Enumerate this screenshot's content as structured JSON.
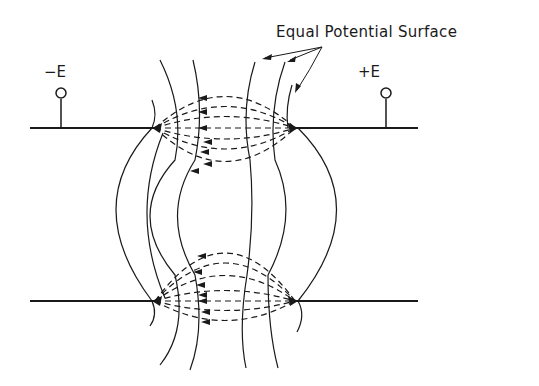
{
  "diagram": {
    "title_label": "Equal Potential Surface",
    "terminals": [
      {
        "label": "−E",
        "polarity": "negative"
      },
      {
        "label": "+E",
        "polarity": "positive"
      }
    ],
    "elements": {
      "electrode_lines": 4,
      "electrode_tips": [
        "top-left",
        "top-right",
        "bottom-left",
        "bottom-right"
      ],
      "field_lines": "dashed arcs with arrows pointing left (toward -E side)",
      "equipotential_lines": "solid vertical curves between electrodes"
    },
    "colors": {
      "ink": "#1a1a1a",
      "background": "#ffffff"
    }
  }
}
